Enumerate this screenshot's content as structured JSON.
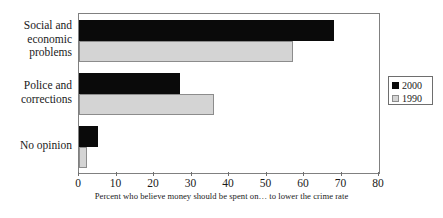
{
  "chart_data": {
    "type": "bar",
    "orientation": "horizontal",
    "title": "",
    "xlabel": "Percent who believe money should be spent on… to lower the crime rate",
    "ylabel": "",
    "xlim": [
      0,
      80
    ],
    "xticks": [
      0,
      10,
      20,
      30,
      40,
      50,
      60,
      70,
      80
    ],
    "xtick_labels": [
      "0",
      "10",
      "20",
      "30",
      "40",
      "50",
      "60",
      "70",
      "80"
    ],
    "grid": false,
    "legend_position": "right",
    "categories": [
      "Social and economic problems",
      "Police and corrections",
      "No opinion"
    ],
    "category_label_lines": [
      [
        "Social and",
        "economic",
        "problems"
      ],
      [
        "Police and",
        "corrections"
      ],
      [
        "No opinion"
      ]
    ],
    "series": [
      {
        "name": "2000",
        "color": "#0a0a0a",
        "values": [
          68,
          27,
          5
        ]
      },
      {
        "name": "1990",
        "color": "#d4d4d4",
        "values": [
          57,
          36,
          2
        ]
      }
    ]
  },
  "legend": {
    "entries": [
      {
        "label": "2000",
        "swatch": "#0a0a0a"
      },
      {
        "label": "1990",
        "swatch": "#d4d4d4"
      }
    ]
  },
  "colors": {
    "series_2000": "#0a0a0a",
    "series_1990": "#d4d4d4",
    "frame": "#808080",
    "text": "#1a1a1a",
    "background": "#ffffff"
  }
}
